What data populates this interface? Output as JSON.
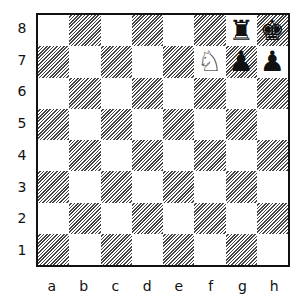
{
  "diagram": {
    "type": "chess-position",
    "orientation": "white-bottom",
    "light_square_color": "#ffffff",
    "dark_square_style": "diagonal-hatch",
    "ranks": [
      "8",
      "7",
      "6",
      "5",
      "4",
      "3",
      "2",
      "1"
    ],
    "files": [
      "a",
      "b",
      "c",
      "d",
      "e",
      "f",
      "g",
      "h"
    ],
    "pieces": [
      {
        "square": "g8",
        "color": "black",
        "piece": "rook",
        "glyph": "♜"
      },
      {
        "square": "h8",
        "color": "black",
        "piece": "king",
        "glyph": "♚"
      },
      {
        "square": "f7",
        "color": "white",
        "piece": "knight",
        "glyph": "♘"
      },
      {
        "square": "g7",
        "color": "black",
        "piece": "pawn",
        "glyph": "♟"
      },
      {
        "square": "h7",
        "color": "black",
        "piece": "pawn",
        "glyph": "♟"
      }
    ]
  }
}
